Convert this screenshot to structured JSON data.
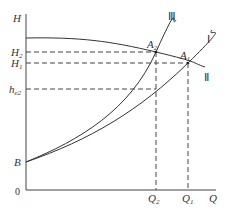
{
  "diagram": {
    "axes": {
      "y_label": "H",
      "x_label": "Q",
      "origin_label": "0"
    },
    "y_ticks": [
      {
        "main": "H",
        "sub": "2"
      },
      {
        "main": "H",
        "sub": "1"
      },
      {
        "main": "h",
        "sub": "e2"
      },
      {
        "main": "B",
        "sub": ""
      }
    ],
    "x_ticks": [
      {
        "main": "Q",
        "sub": "2"
      },
      {
        "main": "Q",
        "sub": "1"
      }
    ],
    "points": [
      {
        "main": "A",
        "sub": "2"
      },
      {
        "main": "A",
        "sub": "1"
      }
    ],
    "curves": [
      "Ⅲ",
      "Ⅰ",
      "Ⅱ"
    ],
    "colors": {
      "line": "#333333",
      "background": "#ffffff"
    }
  }
}
